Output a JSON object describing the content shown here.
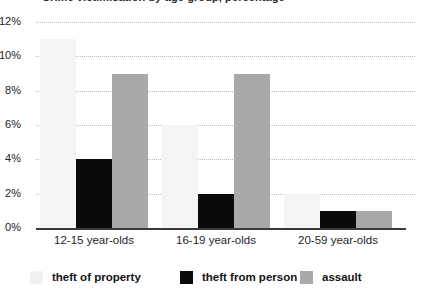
{
  "chart_data": {
    "type": "bar",
    "title": "Crime victimisation by age group, percentage",
    "subtitle": "",
    "xlabel": "",
    "ylabel": "",
    "categories": [
      "12-15 year-olds",
      "16-19 year-olds",
      "20-59 year-olds"
    ],
    "series": [
      {
        "name": "theft of property",
        "color": "#f4f4f4",
        "values": [
          11,
          6,
          2
        ]
      },
      {
        "name": "theft from person",
        "color": "#0a0a0a",
        "values": [
          4,
          2,
          1
        ]
      },
      {
        "name": "assault",
        "color": "#a9a9a9",
        "values": [
          9,
          9,
          1
        ]
      }
    ],
    "series_corrected_note": "",
    "ylim": [
      0,
      12
    ],
    "ytick_values": [
      0,
      2,
      4,
      6,
      8,
      10,
      12
    ],
    "ytick_labels": [
      "0%",
      "2%",
      "4%",
      "6%",
      "8%",
      "10%",
      "12%"
    ],
    "grid": true,
    "grid_style": "dotted-horizontal",
    "legend_position": "bottom"
  },
  "axis": {
    "ticks": [
      {
        "label": "12%",
        "value": 12
      },
      {
        "label": "10%",
        "value": 10
      },
      {
        "label": "8%",
        "value": 8
      },
      {
        "label": "6%",
        "value": 6
      },
      {
        "label": "4%",
        "value": 4
      },
      {
        "label": "2%",
        "value": 2
      },
      {
        "label": "0%",
        "value": 0
      }
    ]
  },
  "legend": {
    "items": [
      {
        "label": "theft of property",
        "swatch": "s0"
      },
      {
        "label": "theft from person",
        "swatch": "s1"
      },
      {
        "label": "assault",
        "swatch": "s2"
      }
    ]
  }
}
